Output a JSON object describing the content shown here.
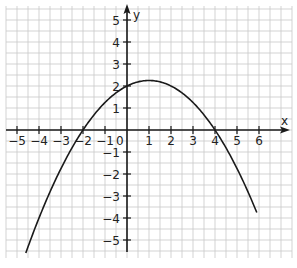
{
  "chart_data": {
    "type": "line",
    "title": "",
    "xlabel": "x",
    "ylabel": "y",
    "xlim": [
      -5.5,
      7.5
    ],
    "ylim": [
      -5.7,
      5.7
    ],
    "grid": true,
    "grid_step": 0.5,
    "x_ticks": [
      -5,
      -4,
      -3,
      -2,
      -1,
      0,
      1,
      2,
      3,
      4,
      5,
      6
    ],
    "x_tick_labels": [
      "−5",
      "−4",
      "−3",
      "−2",
      "−1",
      "0",
      "1",
      "2",
      "3",
      "4",
      "5",
      "6"
    ],
    "y_ticks": [
      -5,
      -4,
      -3,
      -2,
      -1,
      1,
      2,
      3,
      4,
      5
    ],
    "y_tick_labels": [
      "−5",
      "−4",
      "−3",
      "−2",
      "−1",
      "1",
      "2",
      "3",
      "4",
      "5"
    ],
    "series": [
      {
        "name": "parabola",
        "function": "y = -0.25(x+2)(x-4)",
        "x": [
          -4.6,
          -4,
          -3,
          -2,
          -1,
          0,
          1,
          2,
          3,
          4,
          5,
          5.9
        ],
        "values": [
          -5.73,
          -4,
          -1.75,
          0,
          1.25,
          2,
          2.25,
          2,
          1.25,
          0,
          -1.75,
          -5.73
        ]
      }
    ],
    "annotations": {
      "roots": [
        -2,
        4
      ],
      "y_intercept": 2,
      "vertex": [
        1,
        2.25
      ]
    }
  },
  "axes": {
    "x_label": "x",
    "y_label": "y",
    "origin_label": "0"
  },
  "colors": {
    "grid": "#c8c8c8",
    "axis": "#1a1a1a",
    "curve": "#1a1a1a",
    "background": "#ffffff"
  }
}
